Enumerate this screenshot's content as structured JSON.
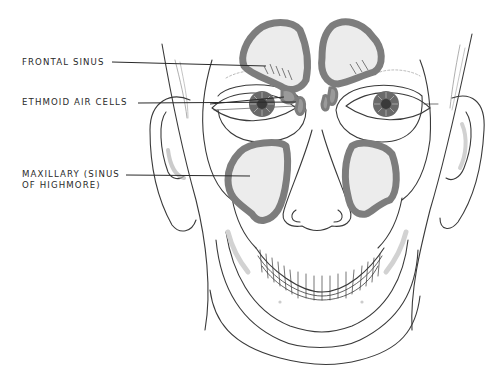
{
  "diagram": {
    "labels": [
      {
        "id": "frontal",
        "text": "FRONTAL SINUS",
        "x": 22,
        "y": 57
      },
      {
        "id": "ethmoid",
        "text": "ETHMOID AIR CELLS",
        "x": 22,
        "y": 97
      },
      {
        "id": "maxillary_1",
        "text": "MAXILLARY (SINUS",
        "x": 22,
        "y": 169
      },
      {
        "id": "maxillary_2",
        "text": "OF HIGHMORE)",
        "x": 22,
        "y": 180
      }
    ],
    "colors": {
      "line": "#3a3a3a",
      "sinus_rim": "#7d7d7d",
      "sinus_fill": "#ececec",
      "iris": "#6a6a6a",
      "accent_gray": "#d2d2d2"
    }
  }
}
